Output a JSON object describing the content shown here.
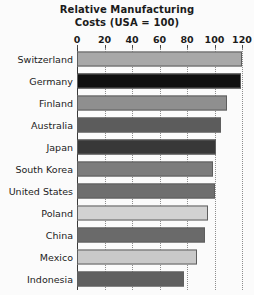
{
  "chart_data": {
    "type": "bar",
    "orientation": "horizontal",
    "title": "Relative Manufacturing Costs (USA = 100)",
    "title_lines": [
      "Relative Manufacturing",
      "Costs (USA = 100)"
    ],
    "xlabel": "",
    "ylabel": "",
    "xlim": [
      0,
      120
    ],
    "xticks": [
      0,
      20,
      40,
      60,
      80,
      100,
      120
    ],
    "xtick_labels": [
      "0",
      "20",
      "40",
      "60",
      "80",
      "100",
      "120"
    ],
    "grid": "vertical-dotted",
    "legend": "none",
    "categories": [
      "Switzerland",
      "Germany",
      "Finland",
      "Australia",
      "Japan",
      "South Korea",
      "United States",
      "Poland",
      "China",
      "Mexico",
      "Indonesia"
    ],
    "values": [
      120,
      119,
      109,
      105,
      101,
      99,
      100,
      95,
      93,
      87,
      78
    ],
    "bar_colors": [
      "#a8a8a8",
      "#101010",
      "#8f8f8f",
      "#5c5c5c",
      "#383838",
      "#7c7c7c",
      "#6e6e6e",
      "#d2d2d2",
      "#6a6a6a",
      "#c9c9c9",
      "#606060"
    ]
  }
}
